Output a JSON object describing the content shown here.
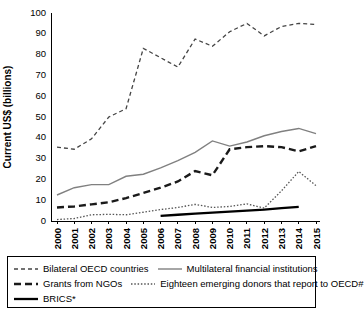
{
  "chart_data": {
    "type": "line",
    "title": "",
    "xlabel": "",
    "ylabel": "Current US$ (billions)",
    "ylim": [
      0,
      100
    ],
    "yticks": [
      0,
      10,
      20,
      30,
      40,
      50,
      60,
      70,
      80,
      90,
      100
    ],
    "grid": false,
    "legend_position": "bottom",
    "categories": [
      "2000",
      "2001",
      "2002",
      "2003",
      "2004",
      "2005",
      "2006",
      "2007",
      "2008",
      "2009",
      "2010",
      "2011",
      "2012",
      "2013",
      "2014",
      "2015"
    ],
    "x": [
      2000,
      2001,
      2002,
      2003,
      2004,
      2005,
      2006,
      2007,
      2008,
      2009,
      2010,
      2011,
      2012,
      2013,
      2014,
      2015
    ],
    "series": [
      {
        "name": "Bilateral OECD countries",
        "style": "dashed",
        "color": "#444444",
        "values": [
          35.5,
          34.5,
          39.5,
          50.0,
          54.0,
          83.0,
          78.5,
          74.0,
          87.5,
          84.0,
          91.0,
          95.0,
          89.0,
          93.5,
          95.0,
          94.5
        ]
      },
      {
        "name": "Multilateral financial institutions",
        "style": "solid-gray",
        "color": "#808080",
        "values": [
          12.5,
          16.0,
          17.5,
          17.5,
          21.5,
          22.5,
          25.5,
          29.0,
          33.0,
          38.5,
          36.0,
          38.0,
          41.0,
          43.0,
          44.5,
          42.0
        ]
      },
      {
        "name": "Grants from NGOs",
        "style": "long-dash",
        "color": "#1a1a1a",
        "values": [
          6.5,
          7.0,
          8.0,
          9.0,
          11.0,
          13.5,
          16.0,
          19.0,
          24.0,
          22.0,
          34.5,
          35.5,
          36.0,
          35.5,
          33.5,
          36.0
        ]
      },
      {
        "name": "Eighteen emerging donors that report to OECD#",
        "style": "dotted",
        "color": "#555555",
        "values": [
          0.7,
          1.2,
          3.0,
          3.2,
          3.0,
          4.2,
          5.5,
          6.5,
          8.0,
          6.5,
          7.0,
          8.2,
          6.2,
          14.5,
          23.8,
          17.0
        ]
      },
      {
        "name": "BRICS*",
        "style": "solid-black",
        "color": "#000000",
        "values": [
          null,
          null,
          null,
          null,
          null,
          null,
          2.5,
          3.0,
          3.5,
          4.0,
          4.5,
          5.0,
          5.5,
          6.2,
          6.8,
          null
        ]
      }
    ]
  },
  "legend": {
    "rows": [
      [
        {
          "label": "Bilateral OECD countries",
          "swatch": "dashed-line-swatch"
        },
        {
          "label": "Multilateral financial institutions",
          "swatch": "solid-gray-line-swatch"
        }
      ],
      [
        {
          "label": "Grants from NGOs",
          "swatch": "long-dash-line-swatch"
        },
        {
          "label": "Eighteen emerging donors that report to OECD#",
          "swatch": "dotted-line-swatch"
        }
      ],
      [
        {
          "label": "BRICS*",
          "swatch": "solid-black-line-swatch"
        }
      ]
    ]
  }
}
